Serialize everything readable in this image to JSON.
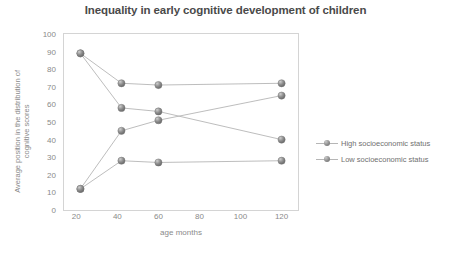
{
  "chart_data": {
    "type": "line",
    "title": "Inequality in early cognitive development of children",
    "xlabel": "age months",
    "ylabel": "Average position in the distribution of cognitive scores",
    "ylabel_line1": "Average position in the distribution of",
    "ylabel_line2": "cognitive scores",
    "x": [
      22,
      42,
      60,
      120
    ],
    "xlim": [
      14,
      128
    ],
    "ylim": [
      0,
      100
    ],
    "grid": false,
    "legend_position": "right",
    "x_ticks": [
      20,
      40,
      60,
      80,
      100,
      120
    ],
    "y_ticks": [
      0,
      10,
      20,
      30,
      40,
      50,
      60,
      70,
      80,
      90,
      100
    ],
    "series": [
      {
        "name": "High socioeconomic status",
        "values": [
          89,
          72,
          71,
          72
        ]
      },
      {
        "name": "Low socioeconomic status",
        "values": [
          89,
          58,
          56,
          40
        ]
      },
      {
        "name": "High socioeconomic status",
        "values": [
          12,
          45,
          51,
          65
        ]
      },
      {
        "name": "Low socioeconomic status",
        "values": [
          12,
          28,
          27,
          28
        ]
      }
    ],
    "marker_color": "#8c8c8c",
    "line_color": "#b6b6b6",
    "frame_color": "#d4d4d4",
    "text_color": "#8a8a8a",
    "title_color": "#4a4a4a"
  },
  "legend": {
    "items": [
      {
        "label": "High socioeconomic status"
      },
      {
        "label": "Low socioeconomic status"
      }
    ]
  }
}
